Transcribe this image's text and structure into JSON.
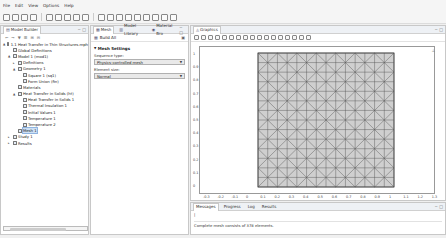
{
  "menu": [
    "File",
    "Edit",
    "View",
    "Options",
    "Help"
  ],
  "toolbar": {
    "buttons": [
      "new",
      "open",
      "save",
      "save-as",
      "undo",
      "redo",
      "copy",
      "paste",
      "delete",
      "parameters",
      "geometry",
      "materials",
      "physics",
      "mesh",
      "study",
      "results",
      "windows",
      "desktop"
    ]
  },
  "model_builder": {
    "title": "Model Builder",
    "tree": [
      {
        "label": "1.1 Heat Transfer in Thin Structures.mph",
        "indent": 0,
        "twisty": "▲",
        "icon": "model-root"
      },
      {
        "label": "Global Definitions",
        "indent": 1,
        "twisty": "",
        "icon": "globe"
      },
      {
        "label": "Model 1 (mod1)",
        "indent": 1,
        "twisty": "▲",
        "icon": "model"
      },
      {
        "label": "Definitions",
        "indent": 2,
        "twisty": "▸",
        "icon": "definitions"
      },
      {
        "label": "Geometry 1",
        "indent": 2,
        "twisty": "▲",
        "icon": "geometry"
      },
      {
        "label": "Square 1 (sq1)",
        "indent": 3,
        "twisty": "",
        "icon": "square"
      },
      {
        "label": "Form Union (fin)",
        "indent": 3,
        "twisty": "",
        "icon": "form-union"
      },
      {
        "label": "Materials",
        "indent": 2,
        "twisty": "",
        "icon": "materials"
      },
      {
        "label": "Heat Transfer in Solids (ht)",
        "indent": 2,
        "twisty": "▲",
        "icon": "heat-transfer"
      },
      {
        "label": "Heat Transfer in Solids 1",
        "indent": 3,
        "twisty": "",
        "icon": "physics-node"
      },
      {
        "label": "Thermal Insulation 1",
        "indent": 3,
        "twisty": "",
        "icon": "physics-node"
      },
      {
        "label": "Initial Values 1",
        "indent": 3,
        "twisty": "",
        "icon": "physics-node"
      },
      {
        "label": "Temperature 1",
        "indent": 3,
        "twisty": "",
        "icon": "physics-node"
      },
      {
        "label": "Temperature 2",
        "indent": 3,
        "twisty": "",
        "icon": "physics-node"
      },
      {
        "label": "Mesh 1",
        "indent": 2,
        "twisty": "",
        "icon": "mesh",
        "selected": true
      },
      {
        "label": "Study 1",
        "indent": 1,
        "twisty": "▸",
        "icon": "study"
      },
      {
        "label": "Results",
        "indent": 1,
        "twisty": "▸",
        "icon": "results"
      }
    ]
  },
  "settings": {
    "tabs": [
      "Mesh",
      "Model Library",
      "Material Bro"
    ],
    "build_all": "Build All",
    "section_title": "Mesh Settings",
    "sequence_type_label": "Sequence type:",
    "sequence_type_value": "Physics-controlled mesh",
    "element_size_label": "Element size:",
    "element_size_value": "Normal"
  },
  "graphics": {
    "title": "Graphics",
    "y_ticks": [
      "1",
      "0.9",
      "0.8",
      "0.7",
      "0.6",
      "0.5",
      "0.4",
      "0.3",
      "0.2",
      "0.1",
      "0"
    ],
    "x_ticks": [
      "-0.3",
      "-0.2",
      "-0.1",
      "0",
      "0.1",
      "0.2",
      "0.3",
      "0.4",
      "0.5",
      "0.6",
      "0.7",
      "0.8",
      "0.9",
      "1",
      "1.1",
      "1.2",
      "1.3"
    ]
  },
  "messages": {
    "tabs": [
      "Messages",
      "Progress",
      "Log",
      "Results"
    ],
    "prompt": "|",
    "line": "Complete mesh consists of 378 elements."
  }
}
